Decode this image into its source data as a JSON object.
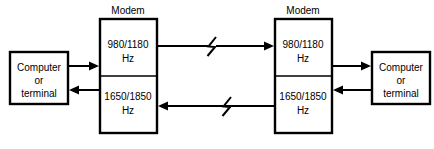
{
  "diagram": {
    "background_color": "#ffffff",
    "line_color": "#000000",
    "nodes": {
      "left_terminal": {
        "name": "left-computer-terminal",
        "line1": "Computer",
        "line2": "or",
        "line3": "terminal"
      },
      "right_terminal": {
        "name": "right-computer-terminal",
        "line1": "Computer",
        "line2": "or",
        "line3": "terminal"
      },
      "left_modem": {
        "caption": "Modem",
        "upper_channel_line1": "980/1180",
        "upper_channel_line2": "Hz",
        "lower_channel_line1": "1650/1850",
        "lower_channel_line2": "Hz"
      },
      "right_modem": {
        "caption": "Modem",
        "upper_channel_line1": "980/1180",
        "upper_channel_line2": "Hz",
        "lower_channel_line1": "1650/1850",
        "lower_channel_line2": "Hz"
      }
    },
    "connections": {
      "left_terminal_to_left_modem": "arrow right into left modem upper channel",
      "left_modem_to_right_modem_upper": "arrow right, line break symbol",
      "right_modem_to_right_terminal": "arrow right into right terminal",
      "right_terminal_to_right_modem_lower": "arrow left into right modem lower channel",
      "right_modem_to_left_modem_lower": "arrow left, line break symbol",
      "left_modem_to_left_terminal": "arrow left into left terminal"
    }
  }
}
